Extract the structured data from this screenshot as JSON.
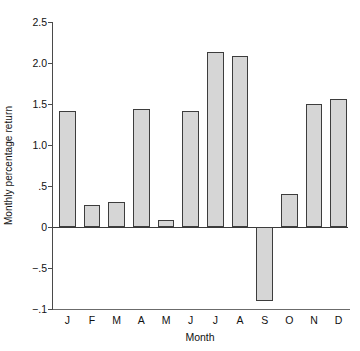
{
  "chart_data": {
    "type": "bar",
    "title": "",
    "xlabel": "Month",
    "ylabel": "Monthly percentage return",
    "categories": [
      "J",
      "F",
      "M",
      "A",
      "M",
      "J",
      "J",
      "A",
      "S",
      "O",
      "N",
      "D"
    ],
    "category_full_names": [
      "January",
      "February",
      "March",
      "April",
      "May",
      "June",
      "July",
      "August",
      "September",
      "October",
      "November",
      "December"
    ],
    "values": [
      1.42,
      0.27,
      0.31,
      1.44,
      0.08,
      1.42,
      2.13,
      2.08,
      -0.9,
      0.4,
      1.5,
      1.56
    ],
    "ylim": [
      -1.0,
      2.5
    ],
    "yticks": [
      2.5,
      2.0,
      1.5,
      1.0,
      0.5,
      0,
      -0.5,
      -1.0
    ],
    "ytick_labels": [
      "2.5",
      "2.0",
      "1.5",
      "1.0",
      ".5",
      "0",
      "−.5",
      "−.1"
    ],
    "grid": false,
    "legend": null,
    "bar_fill_color": "#d6d6d6",
    "bar_edge_color": "#3d3d3d",
    "axis_color": "#4a4a4a",
    "background_color": "#ffffff"
  }
}
